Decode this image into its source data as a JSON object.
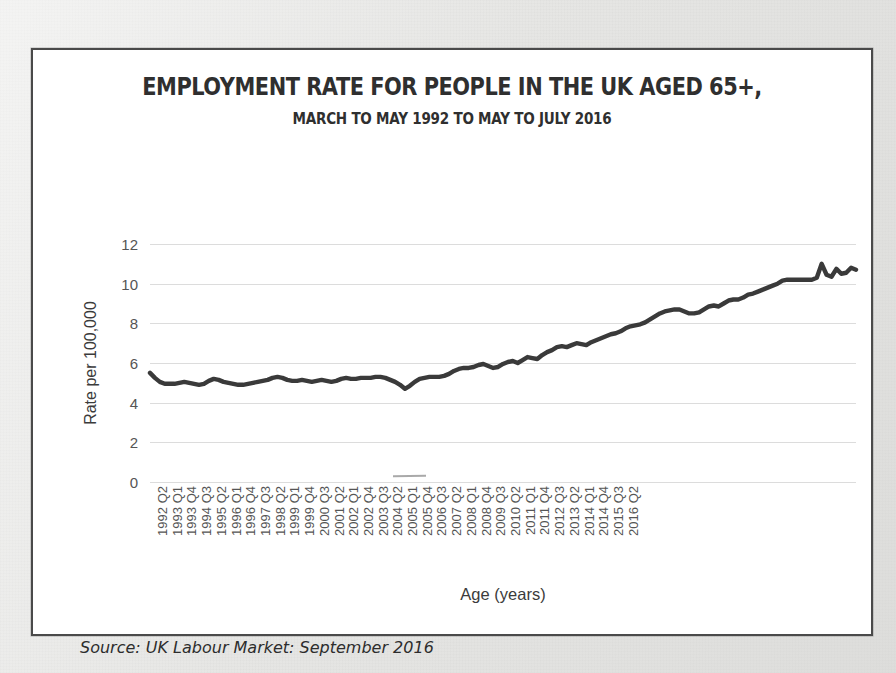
{
  "document": {
    "source_note": "Source: UK Labour Market: September 2016"
  },
  "chart_data": {
    "type": "line",
    "title": "EMPLOYMENT RATE FOR PEOPLE IN THE UK AGED 65+,",
    "subtitle": "MARCH TO MAY 1992 TO MAY TO JULY 2016",
    "xlabel": "Age (years)",
    "ylabel": "Rate per 100,000",
    "ylim": [
      0,
      12
    ],
    "yticks": [
      0,
      2,
      4,
      6,
      8,
      10,
      12
    ],
    "grid": true,
    "legend": "none",
    "line_color": "#3a3a3a",
    "grid_color": "#dcdcdc",
    "tick_label_color": "#555555",
    "x_tick_labels": [
      "1992 Q2",
      "1993 Q1",
      "1993 Q4",
      "1994 Q3",
      "1995 Q2",
      "1996 Q1",
      "1996 Q4",
      "1997 Q3",
      "1998 Q2",
      "1999 Q1",
      "1999 Q4",
      "2000 Q3",
      "2001 Q2",
      "2002 Q1",
      "2002 Q4",
      "2003 Q3",
      "2004 Q2",
      "2005 Q1",
      "2005 Q4",
      "2006 Q3",
      "2007 Q2",
      "2008 Q1",
      "2008 Q4",
      "2009 Q3",
      "2010 Q2",
      "2011 Q1",
      "2011 Q4",
      "2012 Q3",
      "2013 Q2",
      "2014 Q1",
      "2014 Q4",
      "2015 Q3",
      "2016 Q2"
    ],
    "x_tick_interval_quarters": 3,
    "x_start": "1992 Q2",
    "x_end": "2016 Q2",
    "values": [
      5.5,
      5.25,
      5.05,
      4.95,
      4.95,
      4.95,
      5.0,
      5.05,
      5.0,
      4.95,
      4.9,
      4.95,
      5.1,
      5.2,
      5.15,
      5.05,
      5.0,
      4.95,
      4.9,
      4.9,
      4.95,
      5.0,
      5.05,
      5.1,
      5.15,
      5.25,
      5.3,
      5.25,
      5.15,
      5.1,
      5.1,
      5.15,
      5.1,
      5.05,
      5.1,
      5.15,
      5.1,
      5.05,
      5.1,
      5.2,
      5.25,
      5.2,
      5.2,
      5.25,
      5.25,
      5.25,
      5.3,
      5.3,
      5.25,
      5.15,
      5.05,
      4.9,
      4.7,
      4.85,
      5.05,
      5.2,
      5.25,
      5.3,
      5.3,
      5.3,
      5.35,
      5.45,
      5.6,
      5.7,
      5.75,
      5.75,
      5.8,
      5.9,
      5.95,
      5.85,
      5.75,
      5.8,
      5.95,
      6.05,
      6.1,
      6.0,
      6.15,
      6.3,
      6.25,
      6.2,
      6.4,
      6.55,
      6.65,
      6.8,
      6.85,
      6.8,
      6.9,
      7.0,
      6.95,
      6.9,
      7.05,
      7.15,
      7.25,
      7.35,
      7.45,
      7.5,
      7.6,
      7.75,
      7.85,
      7.9,
      7.95,
      8.05,
      8.2,
      8.35,
      8.5,
      8.6,
      8.65,
      8.7,
      8.7,
      8.6,
      8.5,
      8.5,
      8.55,
      8.7,
      8.85,
      8.9,
      8.85,
      9.0,
      9.15,
      9.2,
      9.2,
      9.3,
      9.45,
      9.5,
      9.6,
      9.7,
      9.8,
      9.9,
      10.0,
      10.15,
      10.2,
      10.2,
      10.2,
      10.2,
      10.2,
      10.2,
      10.3,
      11.0,
      10.45,
      10.35,
      10.75,
      10.5,
      10.55,
      10.8,
      10.7
    ]
  }
}
